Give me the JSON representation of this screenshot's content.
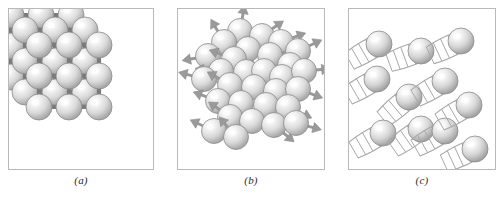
{
  "figure": {
    "background_color": "#ffffff",
    "frame_color": "#b9b9b9",
    "sphere_fill_light": "#f4f4f4",
    "sphere_fill_mid": "#d9d9d9",
    "sphere_fill_dark": "#a9a9a9",
    "sphere_outline": "#8a8a8a",
    "bond_color": "#7a7a7a",
    "arrow_color": "#9a9a9a",
    "trail_color": "#a8a8a8"
  },
  "panels": [
    {
      "id": "a",
      "caption": "(a)",
      "state": "solid",
      "description": "Crystalline solid: atoms fixed in a regular cubic lattice joined by bonds",
      "sphere_count": 27,
      "has_bonds": true,
      "has_motion_arrows": false,
      "has_motion_trails": false,
      "lattice": {
        "type": "cubic",
        "dimensions": [
          3,
          3,
          3
        ],
        "projection": "isometric"
      }
    },
    {
      "id": "b",
      "caption": "(b)",
      "state": "liquid",
      "description": "Liquid: atoms closely packed but disordered, each with a short motion arrow",
      "sphere_count": 30,
      "has_bonds": false,
      "has_motion_arrows": true,
      "has_motion_trails": false
    },
    {
      "id": "c",
      "caption": "(c)",
      "state": "gas",
      "description": "Gas: widely separated atoms moving rapidly, each with a long motion trail",
      "sphere_count": 11,
      "has_bonds": false,
      "has_motion_arrows": false,
      "has_motion_trails": true
    }
  ],
  "chart_data": {
    "type": "diagram",
    "panel_labels": [
      "(a)",
      "(b)",
      "(c)"
    ],
    "panel_states": [
      "solid",
      "liquid",
      "gas"
    ],
    "particle_counts": [
      27,
      30,
      11
    ]
  }
}
